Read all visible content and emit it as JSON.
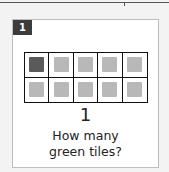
{
  "card": {
    "badge_number": "1",
    "count": "1",
    "question_line1": "How many",
    "question_line2": "green tiles?"
  },
  "grid": {
    "rows": 2,
    "cols": 5,
    "filled_color": "#5a5a5a",
    "empty_color": "#b8b8b8",
    "tiles": [
      {
        "filled": true
      },
      {
        "filled": false
      },
      {
        "filled": false
      },
      {
        "filled": false
      },
      {
        "filled": false
      },
      {
        "filled": false
      },
      {
        "filled": false
      },
      {
        "filled": false
      },
      {
        "filled": false
      },
      {
        "filled": false
      }
    ]
  }
}
